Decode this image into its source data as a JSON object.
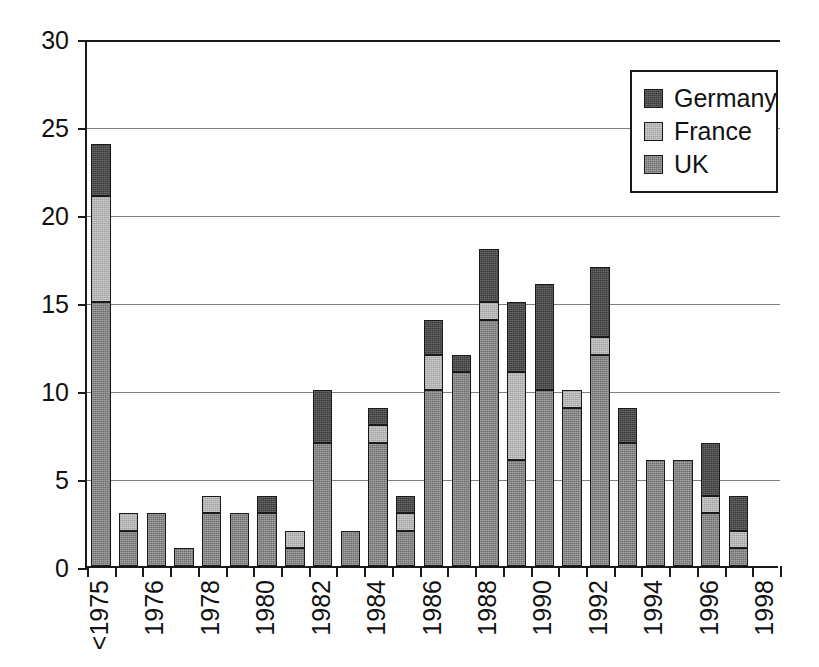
{
  "chart_data": {
    "type": "bar",
    "subtype": "stacked-bar",
    "title": "",
    "subtitle": "",
    "xlabel": "",
    "ylabel": "",
    "ylim": [
      0,
      30
    ],
    "ytick_values": [
      0,
      5,
      10,
      15,
      20,
      25,
      30
    ],
    "ytick_labels": [
      "0",
      "5",
      "10",
      "15",
      "20",
      "25",
      "30"
    ],
    "grid": "horizontal",
    "legend_position": "top-right",
    "categories": [
      "<1975",
      "1975",
      "1976",
      "1977",
      "1978",
      "1979",
      "1980",
      "1981",
      "1982",
      "1983",
      "1984",
      "1985",
      "1986",
      "1987",
      "1988",
      "1989",
      "1990",
      "1991",
      "1992",
      "1993",
      "1994",
      "1995",
      "1996",
      "1997",
      "1998"
    ],
    "xtick_labels": [
      "<1975",
      "",
      "1976",
      "",
      "1978",
      "",
      "1980",
      "",
      "1982",
      "",
      "1984",
      "",
      "1986",
      "",
      "1988",
      "",
      "1990",
      "",
      "1992",
      "",
      "1994",
      "",
      "1996",
      "",
      "1998"
    ],
    "series": [
      {
        "name": "UK",
        "color": "#6e6e6e",
        "values": [
          15,
          2,
          3,
          1,
          3,
          3,
          3,
          1,
          7,
          2,
          7,
          2,
          10,
          11,
          14,
          6,
          10,
          9,
          12,
          7,
          6,
          6,
          3,
          1,
          0
        ]
      },
      {
        "name": "France",
        "color": "#b4b4b4",
        "values": [
          6,
          1,
          0,
          0,
          1,
          0,
          0,
          1,
          0,
          0,
          1,
          1,
          2,
          0,
          1,
          5,
          0,
          1,
          1,
          0,
          0,
          0,
          1,
          1,
          0
        ]
      },
      {
        "name": "Germany",
        "color": "#3a3a3a",
        "values": [
          3,
          0,
          0,
          0,
          0,
          0,
          1,
          0,
          3,
          0,
          1,
          1,
          2,
          1,
          3,
          4,
          6,
          0,
          4,
          2,
          0,
          0,
          3,
          2,
          0
        ]
      }
    ],
    "totals": [
      24,
      3,
      3,
      1,
      4,
      3,
      4,
      2,
      10,
      2,
      9,
      4,
      14,
      12,
      18,
      15,
      16,
      10,
      17,
      9,
      6,
      6,
      7,
      4,
      0
    ]
  },
  "legend": {
    "entries": [
      {
        "label": "Germany",
        "swatch_name": "legend-swatch-germany"
      },
      {
        "label": "France",
        "swatch_name": "legend-swatch-france"
      },
      {
        "label": "UK",
        "swatch_name": "legend-swatch-uk"
      }
    ]
  },
  "colors": {
    "germany": "#3a3a3a",
    "france": "#b4b4b4",
    "uk": "#6e6e6e",
    "axis": "#1a1a1a",
    "grid": "#808080",
    "background": "#ffffff"
  }
}
